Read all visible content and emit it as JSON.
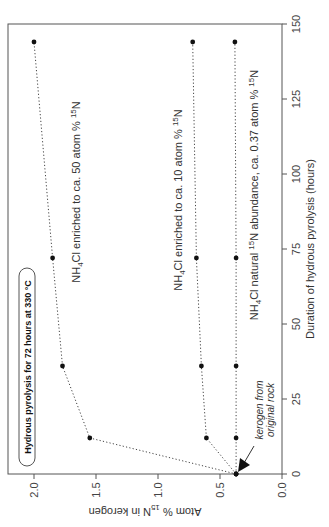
{
  "chart_data": {
    "type": "line",
    "orientation": "rotated-90-ccw",
    "title": "",
    "xlabel": "Duration of hydrous pyrolysis (hours)",
    "ylabel": "Atom % 15N in kerogen",
    "xlim": [
      0,
      150
    ],
    "ylim": [
      0.0,
      2.2
    ],
    "x_ticks": [
      "0",
      "25",
      "50",
      "75",
      "100",
      "125",
      "150"
    ],
    "y_ticks": [
      "0.0",
      "0.5",
      "1.0",
      "1.5",
      "2.0"
    ],
    "grid": false,
    "x": [
      0,
      12,
      36,
      72,
      144
    ],
    "series": [
      {
        "name": "NH4Cl enriched to ca. 50 atom % 15N",
        "values": [
          0.37,
          1.55,
          1.77,
          1.85,
          2.0
        ]
      },
      {
        "name": "NH4Cl enriched to ca. 10 atom % 15N",
        "values": [
          0.37,
          0.61,
          0.65,
          0.69,
          0.72
        ]
      },
      {
        "name": "NH4Cl natural 15N abundance, ca. 0.37 atom % 15N",
        "values": [
          0.37,
          0.37,
          0.37,
          0.37,
          0.38
        ]
      }
    ],
    "annotations": [
      {
        "text": "Hydrous pyrolysis for 72 hours at 330 °C",
        "style": "boxed bold"
      },
      {
        "text": "kerogen from original rock",
        "style": "italic with arrow",
        "points_to": [
          0,
          0.37
        ]
      }
    ]
  },
  "labels": {
    "xaxis_title": "Duration of hydrous pyrolysis (hours)",
    "yaxis_title_pre": "Atom % ",
    "yaxis_title_sup": "15",
    "yaxis_title_post": "N in kerogen",
    "box_annotation": "Hydrous pyrolysis for 72 hours at 330 °C",
    "kerogen_line1": "kerogen from",
    "kerogen_line2": "original rock",
    "series50": {
      "a": "NH",
      "sub": "4",
      "b": "Cl enriched to ca. 50 atom % ",
      "sup": "15",
      "c": "N"
    },
    "series10": {
      "a": "NH",
      "sub": "4",
      "b": "Cl enriched to ca. 10 atom % ",
      "sup": "15",
      "c": "N"
    },
    "seriesNat": {
      "a": "NH",
      "sub": "4",
      "b": "Cl natural ",
      "sup": "15",
      "c": "N abundance, ca. 0.37 atom % ",
      "sup2": "15",
      "d": "N"
    }
  },
  "style": {
    "axis_color": "#555555",
    "line_color": "#444444",
    "point_color": "#111111"
  }
}
